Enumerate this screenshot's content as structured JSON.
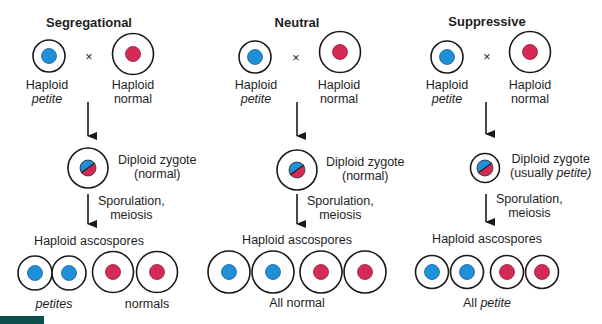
{
  "colors": {
    "outline": "#1a1a1a",
    "petite_mito": "#1f8fd8",
    "normal_mito": "#d42a55",
    "corner_bar": "#0f4e4e"
  },
  "cross_symbol": "×",
  "panels": [
    {
      "title": "Segregational",
      "parent_petite": {
        "line1": "Haploid",
        "line2": "petite"
      },
      "parent_normal": {
        "line1": "Haploid",
        "line2": "normal"
      },
      "zygote": {
        "line1": "Diploid zygote",
        "line2": "(normal)"
      },
      "process": {
        "line1": "Sporulation,",
        "line2": "meiosis"
      },
      "ascospores_label": "Haploid ascospores",
      "ascospores": [
        "petite",
        "petite",
        "normal",
        "normal"
      ],
      "result_labels": [
        "petites",
        "normals"
      ]
    },
    {
      "title": "Neutral",
      "parent_petite": {
        "line1": "Haploid",
        "line2": "petite"
      },
      "parent_normal": {
        "line1": "Haploid",
        "line2": "normal"
      },
      "zygote": {
        "line1": "Diploid zygote",
        "line2": "(normal)"
      },
      "process": {
        "line1": "Sporulation,",
        "line2": "meiosis"
      },
      "ascospores_label": "Haploid ascospores",
      "ascospores": [
        "normal",
        "normal",
        "normal",
        "normal"
      ],
      "result_label": "All normal"
    },
    {
      "title": "Suppressive",
      "parent_petite": {
        "line1": "Haploid",
        "line2": "petite"
      },
      "parent_normal": {
        "line1": "Haploid",
        "line2": "normal"
      },
      "zygote": {
        "line1_a": "Diploid zygote",
        "line2_a": "(usually ",
        "line2_b": "petite",
        "line2_c": ")"
      },
      "process": {
        "line1": "Sporulation,",
        "line2": "meiosis"
      },
      "ascospores_label": "Haploid ascospores",
      "ascospores": [
        "petite",
        "petite",
        "petite",
        "petite"
      ],
      "result_label_a": "All ",
      "result_label_b": "petite"
    }
  ]
}
